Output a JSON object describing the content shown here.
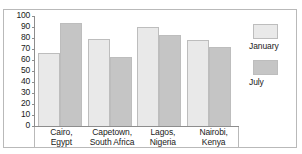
{
  "chart_data": {
    "type": "bar",
    "title": "",
    "xlabel": "",
    "ylabel": "",
    "ylim": [
      0,
      100
    ],
    "yticks": [
      0,
      10,
      20,
      30,
      40,
      50,
      60,
      70,
      80,
      90,
      100
    ],
    "grid": false,
    "legend_position": "right",
    "categories": [
      {
        "line1": "Cairo,",
        "line2": "Egypt"
      },
      {
        "line1": "Capetown,",
        "line2": "South Africa"
      },
      {
        "line1": "Lagos,",
        "line2": "Nigeria"
      },
      {
        "line1": "Nairobi,",
        "line2": "Kenya"
      }
    ],
    "category_labels": [
      "Cairo, Egypt",
      "Capetown, South Africa",
      "Lagos, Nigeria",
      "Nairobi, Kenya"
    ],
    "series": [
      {
        "name": "January",
        "color": "#e9e9e9",
        "values": [
          66,
          79,
          90,
          78
        ]
      },
      {
        "name": "July",
        "color": "#c5c5c5",
        "values": [
          94,
          63,
          83,
          72
        ]
      }
    ]
  },
  "legend": {
    "items": [
      {
        "label": "January",
        "color": "#e9e9e9"
      },
      {
        "label": "July",
        "color": "#c5c5c5"
      }
    ]
  },
  "colors": {
    "january": "#e9e9e9",
    "july": "#c5c5c5",
    "axis": "#8d8d8d",
    "border": "#b9b9b9",
    "text": "#1a1a1a"
  }
}
